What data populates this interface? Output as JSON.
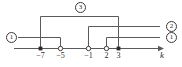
{
  "figure": {
    "type": "number-line-interval-diagram",
    "axis": {
      "name": "k",
      "label": "k",
      "tick_labels": [
        "−7",
        "−5",
        "−1",
        "2",
        "3"
      ],
      "tick_values": [
        -7,
        -5,
        -1,
        2,
        3
      ],
      "arrow": "right"
    },
    "series_labels": [
      {
        "id": "label-3-top",
        "text": "3"
      },
      {
        "id": "label-2-right",
        "text": "2"
      },
      {
        "id": "label-1-right",
        "text": "1"
      },
      {
        "id": "label-1-left",
        "text": "1"
      }
    ],
    "colors": {
      "line": "#5a5a5a",
      "marker": "#2b2b2b",
      "text": "#2b2b2b",
      "background": "#ffffff"
    },
    "segments": [
      {
        "name": "segment-1-left",
        "label": "1",
        "level": "low",
        "start_value": "-∞",
        "end_value": -5,
        "start_marker": "none",
        "end_marker": "open",
        "drop_points": [
          {
            "k": -7,
            "marker": "filled"
          },
          {
            "k": -5,
            "marker": "open"
          }
        ]
      },
      {
        "name": "segment-3-top",
        "label": "3",
        "level": "high",
        "start_value": -7,
        "end_value": 3,
        "start_marker": "filled",
        "end_marker": "filled"
      },
      {
        "name": "segment-2-middle",
        "label": "2",
        "level": "mid",
        "start_value": -1,
        "end_value": "+∞",
        "start_marker": "open",
        "end_marker": "none"
      },
      {
        "name": "segment-1-right",
        "label": "1",
        "level": "low",
        "start_value": 2,
        "end_value": "+∞",
        "start_marker": "open",
        "end_marker": "none"
      }
    ]
  }
}
